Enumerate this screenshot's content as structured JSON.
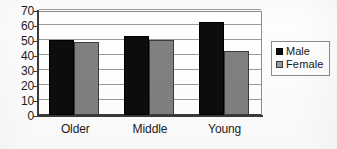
{
  "chart_data": {
    "type": "bar",
    "title": "",
    "subtitle": "",
    "xlabel": "",
    "ylabel": "",
    "categories": [
      "Older",
      "Middle",
      "Young"
    ],
    "series": [
      {
        "name": "Male",
        "color": "#0d0d0d",
        "values": [
          50,
          53,
          62
        ]
      },
      {
        "name": "Female",
        "color": "#808080",
        "values": [
          49,
          50,
          43
        ]
      }
    ],
    "ylim": [
      0,
      70
    ],
    "ytick_step": 10,
    "yticks": [
      70,
      60,
      50,
      40,
      30,
      20,
      10,
      0
    ],
    "ytick_labels": [
      "70",
      "60",
      "50",
      "40",
      "30",
      "20",
      "10",
      "0"
    ],
    "grid": true,
    "grid_axis": "y",
    "legend_position": "right",
    "legend_border": true,
    "plot_border": true
  },
  "legend": {
    "entries": [
      {
        "label": "Male",
        "swatch": "male-swatch"
      },
      {
        "label": "Female",
        "swatch": "female-swatch"
      }
    ]
  },
  "colors": {
    "male": "#0d0d0d",
    "female": "#808080",
    "gridline": "#9a9a9a",
    "axis": "#3a3a3a",
    "plot_background": "#ffffff",
    "page_background": "#fdfdfd"
  }
}
